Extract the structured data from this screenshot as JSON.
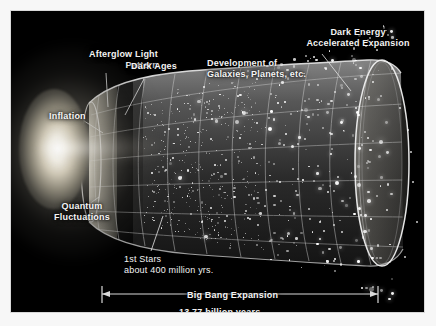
{
  "figure": {
    "kind": "cosmic-timeline-diagram",
    "title_visible": false,
    "background_color": "#000000",
    "mat_color": "#ffffff",
    "text_color": "#f4f4f4"
  },
  "labels": {
    "afterglow": "Afterglow Light\nPattern",
    "dark_ages": "Dark Ages",
    "development": "Development of\nGalaxies, Planets, etc.",
    "dark_energy": "Dark Energy\nAccelerated Expansion",
    "inflation": "Inflation",
    "quantum": "Quantum\nFluctuations",
    "first_stars": "1st Stars\nabout 400 million yrs.",
    "big_bang_expansion": "Big Bang Expansion",
    "age": "13.77 billion years"
  },
  "chart_data": {
    "type": "diagram",
    "xlabel": "Time since the Big Bang",
    "ylabel": "Size of the observable universe",
    "total_span_label": "13.77 billion years",
    "total_span_value": 13.77,
    "total_span_units": "billion years",
    "grid": true,
    "legend": false,
    "epochs": [
      {
        "name": "Quantum Fluctuations",
        "order": 1,
        "x_frac": 0.02,
        "note": "pre-inflation seed perturbations"
      },
      {
        "name": "Inflation",
        "order": 2,
        "x_frac": 0.05,
        "note": "exponential expansion"
      },
      {
        "name": "Afterglow Light Pattern",
        "order": 3,
        "x_frac": 0.11,
        "note": "CMB, 375,000 yrs"
      },
      {
        "name": "Dark Ages",
        "order": 4,
        "x_frac": 0.17,
        "note": "before first light sources"
      },
      {
        "name": "1st Stars",
        "order": 5,
        "x_frac": 0.24,
        "note": "about 400 million yrs."
      },
      {
        "name": "Development of Galaxies, Planets, etc.",
        "order": 6,
        "x_frac": 0.55,
        "note": "structure formation"
      },
      {
        "name": "Dark Energy Accelerated Expansion",
        "order": 7,
        "x_frac": 0.92,
        "note": "late-time acceleration"
      }
    ],
    "annotations": [
      {
        "text": "about 400 million yrs.",
        "attached_to": "1st Stars"
      },
      {
        "text": "13.77 billion years",
        "attached_to": "Big Bang Expansion"
      }
    ]
  }
}
